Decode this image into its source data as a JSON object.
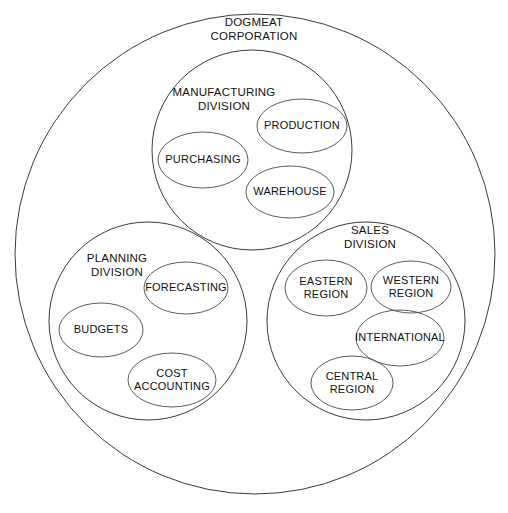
{
  "diagram": {
    "type": "nested-circle-venn-org-chart",
    "background_color": "#ffffff",
    "outline_color": "#3b3b3b",
    "text_color": "#111111",
    "organization": {
      "name": "organization-circle",
      "label": "DOGMEAT\nCORPORATION",
      "label_line1": "DOGMEAT",
      "label_line2": "CORPORATION",
      "cx": 255,
      "cy": 254,
      "r": 240,
      "label_x": 254,
      "label_y": 29
    },
    "divisions": [
      {
        "key": "manufacturing",
        "label": "MANUFACTURING\nDIVISION",
        "label_line1": "MANUFACTURING",
        "label_line2": "DIVISION",
        "cx": 252,
        "cy": 150,
        "r": 100,
        "label_x": 224,
        "label_y": 99,
        "units": [
          {
            "key": "production",
            "label": "PRODUCTION",
            "cx": 302,
            "cy": 126,
            "rx": 45,
            "ry": 27
          },
          {
            "key": "purchasing",
            "label": "PURCHASING",
            "cx": 203,
            "cy": 160,
            "rx": 45,
            "ry": 28
          },
          {
            "key": "warehouse",
            "label": "WAREHOUSE",
            "cx": 290,
            "cy": 192,
            "rx": 44,
            "ry": 26
          }
        ]
      },
      {
        "key": "planning",
        "label": "PLANNING\nDIVISION",
        "label_line1": "PLANNING",
        "label_line2": "DIVISION",
        "cx": 148,
        "cy": 321,
        "r": 99,
        "label_x": 117,
        "label_y": 265,
        "units": [
          {
            "key": "forecasting",
            "label": "FORECASTING",
            "cx": 186,
            "cy": 288,
            "rx": 42,
            "ry": 26
          },
          {
            "key": "budgets",
            "label": "BUDGETS",
            "cx": 101,
            "cy": 330,
            "rx": 42,
            "ry": 27
          },
          {
            "key": "cost-accounting",
            "label": "COST\nACCOUNTING",
            "label_line1": "COST",
            "label_line2": "ACCOUNTING",
            "cx": 172,
            "cy": 380,
            "rx": 44,
            "ry": 27
          }
        ]
      },
      {
        "key": "sales",
        "label": "SALES\nDIVISION",
        "label_line1": "SALES",
        "label_line2": "DIVISION",
        "cx": 366,
        "cy": 321,
        "r": 99,
        "label_x": 370,
        "label_y": 237,
        "units": [
          {
            "key": "eastern-region",
            "label": "EASTERN\nREGION",
            "label_line1": "EASTERN",
            "label_line2": "REGION",
            "cx": 326,
            "cy": 288,
            "rx": 41,
            "ry": 28
          },
          {
            "key": "western-region",
            "label": "WESTERN\nREGION",
            "label_line1": "WESTERN",
            "label_line2": "REGION",
            "cx": 411,
            "cy": 287,
            "rx": 40,
            "ry": 26
          },
          {
            "key": "international",
            "label": "INTERNATIONAL",
            "cx": 400,
            "cy": 338,
            "rx": 44,
            "ry": 28
          },
          {
            "key": "central-region",
            "label": "CENTRAL\nREGION",
            "label_line1": "CENTRAL",
            "label_line2": "REGION",
            "cx": 352,
            "cy": 383,
            "rx": 41,
            "ry": 27
          }
        ]
      }
    ]
  }
}
